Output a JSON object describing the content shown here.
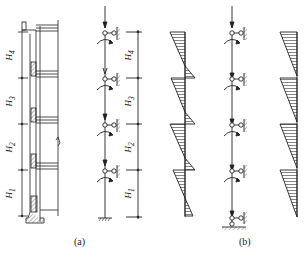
{
  "figure": {
    "panel_a": {
      "caption": "(a)",
      "story_labels": [
        "H4",
        "H3",
        "H2",
        "H1"
      ],
      "story_subscripts": [
        "4",
        "3",
        "2",
        "1"
      ]
    },
    "panel_b": {
      "caption": "(b)"
    },
    "story_letter": "H",
    "floor_levels_y": [
      32,
      78,
      124,
      170,
      217
    ],
    "colors": {
      "line": "#222222",
      "hatch": "#333333",
      "background": "#ffffff"
    }
  }
}
